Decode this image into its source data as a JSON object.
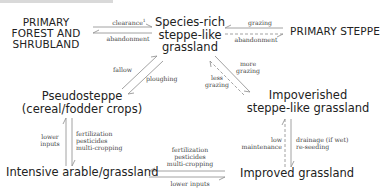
{
  "diagram": {
    "nodes": {
      "primary_forest": "PRIMARY\nFOREST AND\nSHRUBLAND",
      "species_rich": "Species-rich\nsteppe-like\ngrassland",
      "primary_steppe": "PRIMARY STEPPE",
      "pseudosteppe": "Pseudosteppe\n(cereal/fodder crops)",
      "impoverished": "Impoverished\nsteppe-like grassland",
      "intensive": "Intensive arable/grassland",
      "improved": "Improved grassland"
    },
    "edges": {
      "clearance": "clearance",
      "clearance_note": "1",
      "abandonment_forest": "abandonment",
      "grazing_steppe": "grazing",
      "abandonment_steppe": "abandonment",
      "fallow": "fallow",
      "ploughing": "ploughing",
      "more_grazing": "more\ngrazing",
      "less_grazing": "less\ngrazing",
      "lower_inputs_left": "lower\ninputs",
      "intensification_left": "fertilization\npesticides\nmulti-cropping",
      "intensification_bottom": "fertilization\npesticides\nmulti-cropping",
      "lower_inputs_bottom": "lower inputs",
      "low_maintenance": "low\nmaintenance",
      "drainage": "drainage (if wet)\nre-seeding"
    },
    "colors": {
      "arrow": "#8a8a8a",
      "text": "#222222",
      "label": "#444444"
    }
  }
}
